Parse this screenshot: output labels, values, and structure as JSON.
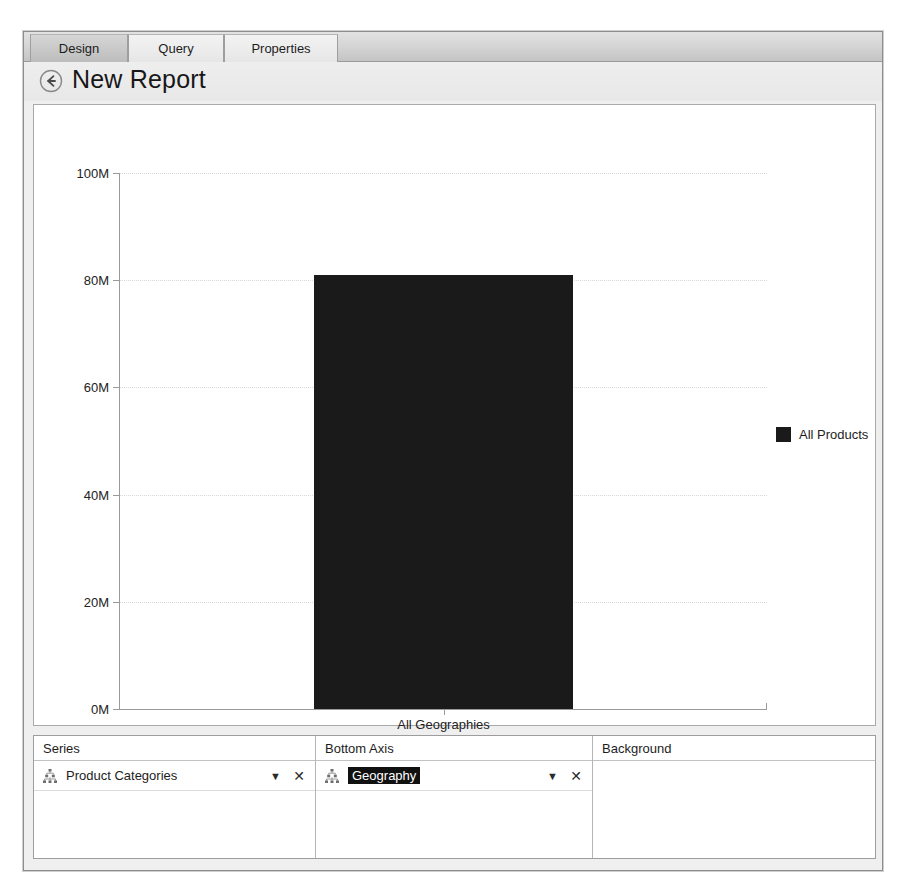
{
  "window": {
    "tabs": [
      {
        "label": "Design",
        "active": true
      },
      {
        "label": "Query",
        "active": false
      },
      {
        "label": "Properties",
        "active": false
      }
    ],
    "title": "New Report",
    "back_icon": "back-arrow-icon"
  },
  "chart_data": {
    "type": "bar",
    "title": "",
    "subtitle": "",
    "xlabel": "",
    "ylabel": "",
    "categories": [
      "All Geographies"
    ],
    "series": [
      {
        "name": "All Products",
        "values": [
          81000000
        ],
        "color": "#1a1a1a"
      }
    ],
    "ylim": [
      0,
      100000000
    ],
    "y_ticks": [
      0,
      20000000,
      40000000,
      60000000,
      80000000,
      100000000
    ],
    "y_tick_labels": [
      "0M",
      "20M",
      "40M",
      "60M",
      "80M",
      "100M"
    ],
    "legend": {
      "position": "right",
      "entries": [
        "All Products"
      ]
    },
    "grid": true,
    "grid_axis": "y"
  },
  "field_panels": [
    {
      "header": "Series",
      "icon": "hierarchy-icon",
      "field": "Product Categories",
      "selected": false,
      "dropdown_icon": "chevron-down-icon",
      "remove_icon": "close-icon",
      "has_row": true
    },
    {
      "header": "Bottom Axis",
      "icon": "hierarchy-icon",
      "field": "Geography",
      "selected": true,
      "dropdown_icon": "chevron-down-icon",
      "remove_icon": "close-icon",
      "has_row": true
    },
    {
      "header": "Background",
      "icon": "",
      "field": "",
      "selected": false,
      "dropdown_icon": "",
      "remove_icon": "",
      "has_row": false
    }
  ]
}
